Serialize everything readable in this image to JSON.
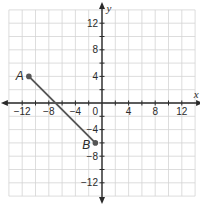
{
  "chart_data": {
    "type": "scatter",
    "title": "",
    "xlabel": "x",
    "ylabel": "y",
    "xlim": [
      -14,
      14
    ],
    "ylim": [
      -14,
      14
    ],
    "grid": true,
    "grid_step": 2,
    "x_ticks": [
      -12,
      -8,
      -4,
      4,
      8,
      12
    ],
    "y_ticks": [
      12,
      8,
      4,
      -4,
      -8,
      -12
    ],
    "origin_label": "0",
    "points": [
      {
        "label": "A",
        "x": -11,
        "y": 4
      },
      {
        "label": "B",
        "x": -1,
        "y": -6
      }
    ],
    "segments": [
      {
        "from": "A",
        "to": "B"
      }
    ],
    "colors": {
      "grid": "#d4d4d4",
      "axis": "#2a2a2a",
      "segment": "#555555",
      "point": "#555555"
    }
  }
}
